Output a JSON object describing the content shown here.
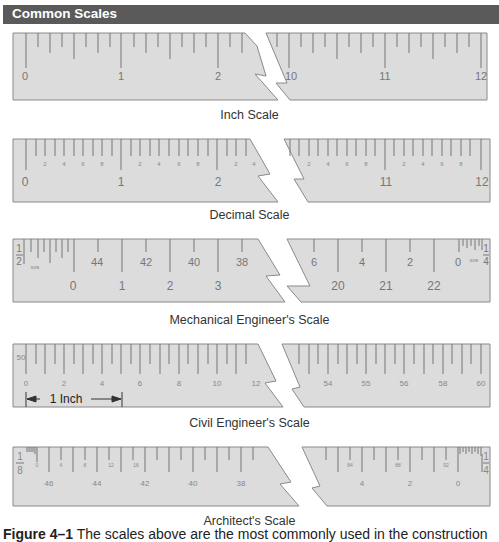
{
  "header": {
    "title": "Common Scales"
  },
  "colors": {
    "ruler_fill": "#dcdcdc",
    "ruler_stroke": "#8a8a8a",
    "tick": "#777777",
    "text": "#777777",
    "header_bg": "#5a5a5a"
  },
  "scales": [
    {
      "name": "Inch Scale",
      "left_numbers": [
        "0",
        "1",
        "2"
      ],
      "right_numbers": [
        "10",
        "11",
        "12"
      ]
    },
    {
      "name": "Decimal Scale",
      "left_numbers": [
        "0",
        "1",
        "2"
      ],
      "left_small": [
        "2",
        "4",
        "6",
        "8",
        "2",
        "4",
        "6",
        "8",
        "2",
        "4"
      ],
      "right_numbers": [
        "11",
        "12"
      ],
      "right_small": [
        "2",
        "4",
        "6",
        "8",
        "2",
        "4",
        "6",
        "8"
      ]
    },
    {
      "name": "Mechanical Engineer's Scale",
      "left_fraction": {
        "num": "1",
        "den": "2"
      },
      "left_size": "SIZE",
      "left_top": [
        "44",
        "42",
        "40",
        "38"
      ],
      "left_bottom": [
        "0",
        "1",
        "2",
        "3"
      ],
      "right_top": [
        "6",
        "4",
        "2",
        "0"
      ],
      "right_bottom": [
        "20",
        "21",
        "22"
      ],
      "right_size": "SIZE",
      "right_fraction": {
        "num": "1",
        "den": "4"
      }
    },
    {
      "name": "Civil Engineer's Scale",
      "left_mark": "50",
      "left_numbers": [
        "0",
        "2",
        "4",
        "6",
        "8",
        "10",
        "12"
      ],
      "right_numbers": [
        "54",
        "55",
        "56",
        "58",
        "60"
      ],
      "dimension_label": "1 Inch"
    },
    {
      "name": "Architect's Scale",
      "left_fraction": {
        "num": "1",
        "den": "8"
      },
      "left_small": [
        "0",
        "4",
        "8",
        "12",
        "16"
      ],
      "left_bottom": [
        "46",
        "44",
        "42",
        "40",
        "38"
      ],
      "right_small": [
        "84",
        "88",
        "92"
      ],
      "right_bottom": [
        "4",
        "2",
        "0"
      ],
      "right_fraction": {
        "num": "1",
        "den": "4"
      }
    }
  ],
  "caption": {
    "figure": "Figure 4–1",
    "text": "The scales above are the most commonly used in the construction"
  }
}
